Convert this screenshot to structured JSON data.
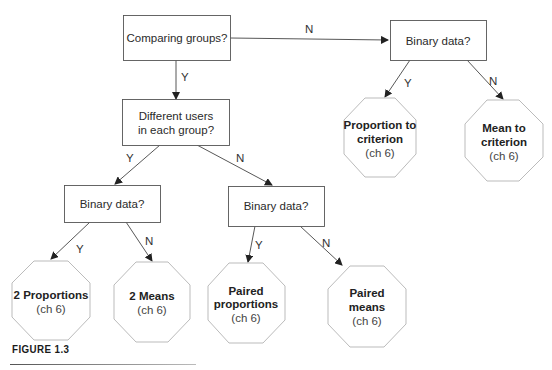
{
  "nodes": {
    "comparing_groups": "Comparing groups?",
    "binary_data_top": "Binary data?",
    "different_users_line1": "Different users",
    "different_users_line2": "in each group?",
    "binary_data_left": "Binary data?",
    "binary_data_mid": "Binary data?"
  },
  "outcomes": {
    "proportion_to_criterion": {
      "line1": "Proportion to",
      "line2": "criterion",
      "chapter": "(ch 6)"
    },
    "mean_to_criterion": {
      "line1": "Mean to",
      "line2": "criterion",
      "chapter": "(ch 6)"
    },
    "two_proportions": {
      "line1": "2 Proportions",
      "chapter": "(ch 6)"
    },
    "two_means": {
      "line1": "2 Means",
      "chapter": "(ch 6)"
    },
    "paired_proportions": {
      "line1": "Paired",
      "line2": "proportions",
      "chapter": "(ch 6)"
    },
    "paired_means": {
      "line1": "Paired",
      "line2": "means",
      "chapter": "(ch 6)"
    }
  },
  "edges": {
    "comparing_to_binary_top": "N",
    "comparing_to_different": "Y",
    "binary_top_to_proportion": "Y",
    "binary_top_to_mean": "N",
    "different_to_binary_left": "Y",
    "different_to_binary_mid": "N",
    "binary_left_to_two_props": "Y",
    "binary_left_to_two_means": "N",
    "binary_mid_to_paired_props": "Y",
    "binary_mid_to_paired_means": "N"
  },
  "caption": "FIGURE 1.3",
  "colors": {
    "box_stroke": "#555555",
    "octagon_stroke": "#b8b8b8",
    "arrow": "#333333"
  }
}
